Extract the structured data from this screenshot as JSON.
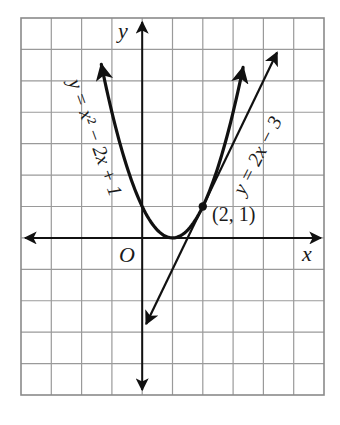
{
  "chart_data": {
    "type": "line",
    "title": "",
    "xlabel": "x",
    "ylabel": "y",
    "origin_label": "O",
    "xlim": [
      -4,
      6
    ],
    "ylim": [
      -5,
      7
    ],
    "grid": true,
    "grid_step": 1,
    "series": [
      {
        "name": "y = x² − 2x + 1",
        "label_text": "y = x² − 2x + 1",
        "kind": "parabola",
        "expression": "x^2 - 2x + 1",
        "x_range": [
          -1.35,
          3.33
        ],
        "vertex": [
          1,
          0
        ],
        "x": [
          -1.35,
          -1,
          0,
          1,
          2,
          3,
          3.33
        ],
        "y": [
          5.52,
          4,
          1,
          0,
          1,
          4,
          5.42
        ]
      },
      {
        "name": "y = 2x − 3",
        "label_text": "y = 2x − 3",
        "kind": "line",
        "expression": "2x - 3",
        "x_range": [
          0.13,
          4.45
        ],
        "x": [
          0.13,
          1,
          2,
          3,
          4,
          4.45
        ],
        "y": [
          -2.74,
          -1,
          1,
          3,
          5,
          5.9
        ]
      }
    ],
    "annotations": [
      {
        "text": "(2, 1)",
        "point": [
          2,
          1
        ],
        "marker": "dot",
        "note": "point of tangency"
      }
    ]
  },
  "labels": {
    "x_axis": "x",
    "y_axis": "y",
    "origin": "O",
    "parabola": "y = x² − 2x + 1",
    "tangent_line": "y = 2x − 3",
    "point": "(2, 1)"
  }
}
